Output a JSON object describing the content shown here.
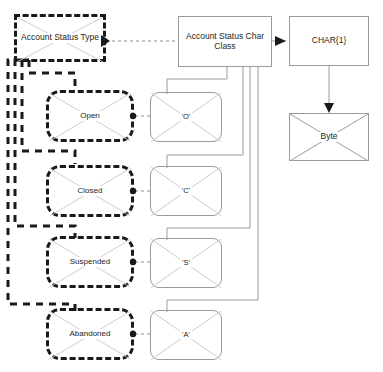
{
  "diagram": {
    "background_color": "#ffffff",
    "solid_stroke_color": "#9a9a9a",
    "dashed_stroke_color": "#1a1a1a",
    "text_color": "#231f20",
    "nodes": {
      "account_status_type": {
        "label": "Account Status Type",
        "shape": "dashed-rectangle-crossed"
      },
      "account_status_char_class": {
        "label": "Account Status Char Class",
        "shape": "solid-rectangle"
      },
      "char_type": {
        "label": "CHAR{1}",
        "shape": "solid-rectangle"
      },
      "byte": {
        "label": "Byte",
        "shape": "solid-rectangle-crossed"
      },
      "open": {
        "label": "Open",
        "shape": "dashed-rounded-crossed"
      },
      "closed": {
        "label": "Closed",
        "shape": "dashed-rounded-crossed"
      },
      "suspended": {
        "label": "Suspended",
        "shape": "dashed-rounded-crossed"
      },
      "abandoned": {
        "label": "Abandoned",
        "shape": "dashed-rounded-crossed"
      },
      "open_char": {
        "label": "'O'",
        "shape": "solid-rounded-crossed"
      },
      "closed_char": {
        "label": "'C'",
        "shape": "solid-rounded-crossed"
      },
      "suspended_char": {
        "label": "'S'",
        "shape": "solid-rounded-crossed"
      },
      "abandoned_char": {
        "label": "'A'",
        "shape": "solid-rounded-crossed"
      }
    }
  }
}
